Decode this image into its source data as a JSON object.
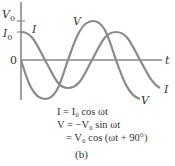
{
  "figure": {
    "axes": {
      "y_labels": {
        "v0": "V",
        "v0_sub": "0",
        "i0": "I",
        "i0_sub": "0",
        "zero": "0"
      },
      "x_label": "t"
    },
    "curves": [
      {
        "name": "I",
        "label": "I",
        "function": "I0 cos(ωt)",
        "color": "#8a8a8a"
      },
      {
        "name": "V",
        "label": "V",
        "function": "-V0 sin(ωt)",
        "color": "#8a8a8a"
      }
    ],
    "equations": {
      "line1": "I = I₀ cos ωt",
      "line2": "V = −V₀ sin ωt",
      "line3": "= V₀ cos (ωt + 90°)"
    },
    "caption": "(b)"
  }
}
